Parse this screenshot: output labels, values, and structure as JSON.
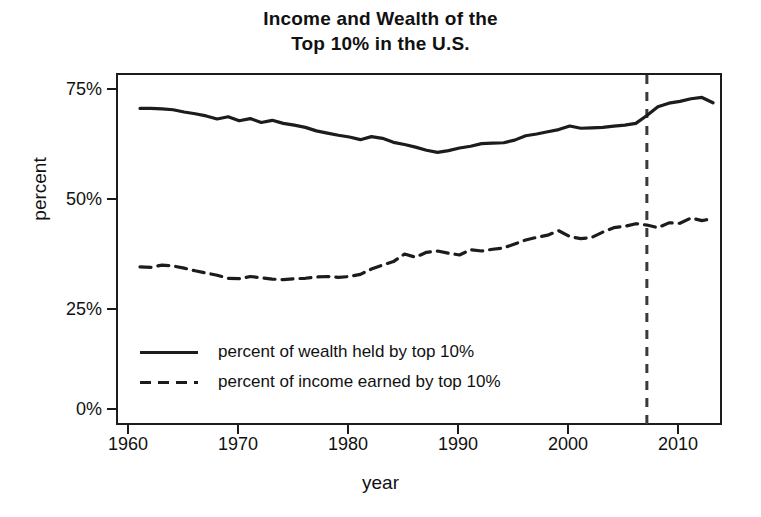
{
  "chart_data": {
    "type": "line",
    "title": "Income and Wealth of the Top 10% in the U.S.",
    "title_line1": "Income and Wealth of the",
    "title_line2": "Top 10% in the U.S.",
    "xlabel": "year",
    "ylabel": "percent",
    "xlim": [
      1960,
      2015
    ],
    "ylim": [
      0,
      80
    ],
    "grid": false,
    "legend_position": "lower-left-inside",
    "xticks": [
      1960,
      1970,
      1980,
      1990,
      2000,
      2010
    ],
    "xtick_labels": [
      "1960",
      "1970",
      "1980",
      "1990",
      "2000",
      "2010"
    ],
    "yticks": [
      0,
      25,
      50,
      75
    ],
    "ytick_labels": [
      "0%",
      "25%",
      "50%",
      "75%"
    ],
    "annotations": [
      {
        "type": "vline",
        "x": 2008,
        "style": "dashed",
        "label": ""
      }
    ],
    "series": [
      {
        "name": "percent of wealth held by top 10%",
        "style": "solid",
        "x": [
          1962,
          1963,
          1964,
          1965,
          1966,
          1967,
          1968,
          1969,
          1970,
          1971,
          1972,
          1973,
          1974,
          1975,
          1976,
          1977,
          1978,
          1979,
          1980,
          1981,
          1982,
          1983,
          1984,
          1985,
          1986,
          1987,
          1988,
          1989,
          1990,
          1991,
          1992,
          1993,
          1994,
          1995,
          1996,
          1997,
          1998,
          1999,
          2000,
          2001,
          2002,
          2003,
          2004,
          2005,
          2006,
          2007,
          2008,
          2009,
          2010,
          2011,
          2012,
          2013,
          2014
        ],
        "values": [
          72.4,
          72.4,
          72.3,
          72.1,
          71.6,
          71.2,
          70.7,
          70.0,
          70.5,
          69.6,
          70.1,
          69.2,
          69.7,
          69.0,
          68.6,
          68.1,
          67.3,
          66.8,
          66.3,
          65.9,
          65.3,
          66.0,
          65.6,
          64.7,
          64.2,
          63.6,
          62.9,
          62.4,
          62.8,
          63.4,
          63.8,
          64.4,
          64.5,
          64.6,
          65.2,
          66.2,
          66.6,
          67.1,
          67.6,
          68.4,
          67.9,
          68.0,
          68.1,
          68.4,
          68.6,
          69.0,
          70.8,
          72.8,
          73.6,
          74.0,
          74.6,
          74.9,
          73.7
        ]
      },
      {
        "name": "percent of income earned by top 10%",
        "style": "dashed",
        "x": [
          1962,
          1963,
          1964,
          1965,
          1966,
          1967,
          1968,
          1969,
          1970,
          1971,
          1972,
          1973,
          1974,
          1975,
          1976,
          1977,
          1978,
          1979,
          1980,
          1981,
          1982,
          1983,
          1984,
          1985,
          1986,
          1987,
          1988,
          1989,
          1990,
          1991,
          1992,
          1993,
          1994,
          1995,
          1996,
          1997,
          1998,
          1999,
          2000,
          2001,
          2002,
          2003,
          2004,
          2005,
          2006,
          2007,
          2008,
          2009,
          2010,
          2011,
          2012,
          2013,
          2014
        ],
        "values": [
          36.4,
          36.3,
          36.8,
          36.6,
          36.1,
          35.5,
          35.0,
          34.5,
          33.8,
          33.7,
          34.2,
          33.9,
          33.6,
          33.5,
          33.7,
          33.8,
          34.1,
          34.2,
          34.0,
          34.2,
          34.7,
          35.9,
          36.8,
          37.6,
          39.3,
          38.6,
          39.7,
          40.0,
          39.5,
          39.1,
          40.3,
          40.0,
          40.4,
          40.7,
          41.6,
          42.5,
          43.1,
          43.6,
          44.6,
          43.3,
          42.8,
          43.1,
          44.3,
          45.3,
          45.6,
          46.2,
          45.9,
          45.3,
          46.4,
          46.3,
          47.5,
          46.9,
          47.4
        ]
      }
    ]
  },
  "legend": {
    "items": [
      {
        "key": "solid-line-key",
        "label": "percent of wealth held by top 10%"
      },
      {
        "key": "dashed-line-key",
        "label": "percent of income earned by top 10%"
      }
    ]
  },
  "colors": {
    "line": "#1c1c1c",
    "axis": "#1c1c1c",
    "background": "#ffffff",
    "annotation": "#3a3a3a"
  }
}
